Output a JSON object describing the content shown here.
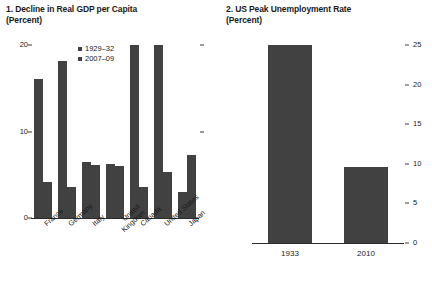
{
  "figure": {
    "background": "#ffffff",
    "bar_color": "#414141",
    "axis_color": "#2b2b2b"
  },
  "panels": [
    {
      "id": "panel-left",
      "title": "1. Decline in Real GDP per Capita\n   (Percent)"
    },
    {
      "id": "panel-right",
      "title": "2. US Peak Unemployment Rate\n   (Percent)"
    }
  ],
  "legend": {
    "items": [
      {
        "label": "1929–32",
        "color": "#414141"
      },
      {
        "label": "2007–09",
        "color": "#414141"
      }
    ]
  },
  "chart_data": [
    {
      "type": "bar",
      "title": "1. Decline in Real GDP per Capita (Percent)",
      "xlabel": "",
      "ylabel": "Percent",
      "ylim": [
        0,
        20
      ],
      "yticks": [
        0,
        10,
        20
      ],
      "ytick_labels": [
        "0",
        "10",
        "20"
      ],
      "grid": false,
      "legend_position": "upper-center",
      "categories": [
        "France",
        "Germany",
        "Italy",
        "United\nKingdom",
        "Canada",
        "United States",
        "Japan"
      ],
      "series": [
        {
          "name": "1929–32",
          "color": "#414141",
          "values": [
            16.1,
            18.1,
            6.5,
            6.3,
            20.0,
            20.0,
            3.0
          ]
        },
        {
          "name": "2007–09",
          "color": "#414141",
          "values": [
            4.2,
            3.6,
            6.1,
            6.0,
            3.6,
            5.3,
            7.3
          ]
        }
      ]
    },
    {
      "type": "bar",
      "title": "2. US Peak Unemployment Rate (Percent)",
      "xlabel": "",
      "ylabel": "Percent",
      "ylim": [
        0,
        25
      ],
      "yticks": [
        0,
        5,
        10,
        15,
        20,
        25
      ],
      "ytick_labels": [
        "0",
        "5",
        "10",
        "15",
        "20",
        "25"
      ],
      "ytick_side": "right",
      "grid": false,
      "categories": [
        "1933",
        "2010"
      ],
      "values": [
        25.0,
        9.6
      ],
      "series": [
        {
          "name": "US Peak Unemployment Rate",
          "color": "#414141",
          "values": [
            25.0,
            9.6
          ]
        }
      ]
    }
  ]
}
